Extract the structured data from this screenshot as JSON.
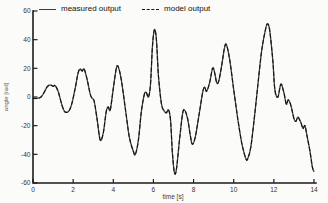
{
  "figure": {
    "background": "#fbfbf9",
    "axis_color": "#1c1c1c",
    "tick_label_color": "#333333"
  },
  "chart_data": {
    "type": "line",
    "title": "",
    "xlabel": "time [s]",
    "ylabel": "angle [rad]",
    "xlim": [
      0,
      14
    ],
    "ylim": [
      -60,
      60
    ],
    "xticks": [
      0,
      2,
      4,
      6,
      8,
      10,
      12,
      14
    ],
    "yticks": [
      -60,
      -40,
      -20,
      0,
      20,
      40,
      60
    ],
    "grid": false,
    "legend_position": "top",
    "x": [
      0,
      0.2,
      0.4,
      0.55,
      0.7,
      0.85,
      1.0,
      1.1,
      1.25,
      1.45,
      1.6,
      1.8,
      1.95,
      2.1,
      2.25,
      2.35,
      2.45,
      2.55,
      2.7,
      2.85,
      2.95,
      3.05,
      3.2,
      3.35,
      3.5,
      3.65,
      3.75,
      3.85,
      4.0,
      4.15,
      4.25,
      4.4,
      4.6,
      4.8,
      5.0,
      5.1,
      5.25,
      5.4,
      5.55,
      5.65,
      5.75,
      5.85,
      5.95,
      6.05,
      6.15,
      6.25,
      6.4,
      6.55,
      6.65,
      6.75,
      6.85,
      6.95,
      7.05,
      7.15,
      7.3,
      7.45,
      7.55,
      7.7,
      7.85,
      7.95,
      8.1,
      8.3,
      8.45,
      8.55,
      8.65,
      8.8,
      8.95,
      9.05,
      9.15,
      9.25,
      9.4,
      9.55,
      9.65,
      9.8,
      10.0,
      10.2,
      10.4,
      10.6,
      10.7,
      10.85,
      11.0,
      11.2,
      11.4,
      11.6,
      11.7,
      11.8,
      11.95,
      12.05,
      12.2,
      12.35,
      12.5,
      12.62,
      12.72,
      12.85,
      13.0,
      13.1,
      13.2,
      13.35,
      13.45,
      13.55,
      13.65,
      13.8,
      13.92,
      14.0
    ],
    "series": [
      {
        "name": "measured output",
        "style": "solid",
        "color": "#464646",
        "values": [
          -1,
          -1,
          0,
          3,
          7,
          8.5,
          7.5,
          8,
          4,
          -6,
          -10.5,
          -9.5,
          -4,
          6,
          17,
          19.5,
          18,
          19.5,
          12,
          2,
          -1,
          -3,
          -16,
          -30,
          -25,
          -10,
          -7,
          -9,
          6,
          20,
          21,
          12,
          -8,
          -28,
          -38,
          -40,
          -30,
          -10,
          2,
          3,
          0,
          8,
          35,
          47,
          40,
          15,
          -5,
          -10,
          -11,
          -9,
          -16,
          -40,
          -53,
          -50,
          -30,
          -12,
          -9,
          -15,
          -28,
          -33,
          -27,
          -10,
          3,
          7,
          4,
          10,
          20,
          17,
          10,
          11,
          22,
          35,
          36,
          26,
          5,
          -15,
          -32,
          -43,
          -43,
          -35,
          -18,
          8,
          33,
          48,
          51,
          46,
          25,
          5,
          0,
          9,
          3,
          -5,
          -2,
          -6,
          -15,
          -17,
          -14,
          -18,
          -22,
          -20,
          -27,
          -38,
          -49,
          -52
        ]
      },
      {
        "name": "model output",
        "style": "dashed",
        "color": "#141414",
        "values": [
          -1,
          -1,
          0,
          3,
          7,
          8.5,
          7.5,
          8,
          4,
          -6,
          -10.5,
          -9.5,
          -4,
          6,
          17,
          19.5,
          18,
          19.5,
          12,
          2,
          -1,
          -3,
          -16,
          -30,
          -25,
          -10,
          -7,
          -9,
          6,
          20,
          21,
          12,
          -8,
          -28,
          -38,
          -40,
          -30,
          -10,
          2,
          3,
          0,
          8,
          35,
          47,
          40,
          15,
          -5,
          -10,
          -11,
          -9,
          -16,
          -40,
          -53,
          -50,
          -30,
          -12,
          -9,
          -15,
          -28,
          -33,
          -27,
          -10,
          3,
          7,
          4,
          10,
          20,
          17,
          10,
          11,
          22,
          35,
          36,
          26,
          5,
          -15,
          -32,
          -43,
          -43,
          -35,
          -18,
          8,
          33,
          48,
          51,
          46,
          25,
          5,
          0,
          9,
          3,
          -5,
          -2,
          -6,
          -15,
          -17,
          -14,
          -18,
          -22,
          -20,
          -27,
          -38,
          -49,
          -52
        ]
      }
    ]
  }
}
